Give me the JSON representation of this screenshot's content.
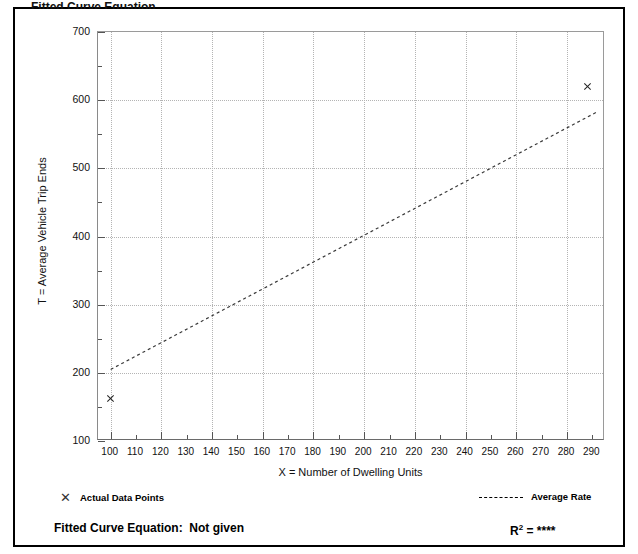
{
  "page": {
    "top_caption": "Fitted Curve Equation"
  },
  "chart_data": {
    "type": "scatter",
    "title": "",
    "xlabel": "X = Number of Dwelling Units",
    "ylabel": "T = Average Vehicle Trip Ends",
    "xlim": [
      95,
      295
    ],
    "ylim": [
      100,
      700
    ],
    "xticks": [
      100,
      110,
      120,
      130,
      140,
      150,
      160,
      170,
      180,
      190,
      200,
      210,
      220,
      230,
      240,
      250,
      260,
      270,
      280,
      290
    ],
    "yticks": [
      100,
      200,
      300,
      400,
      500,
      600,
      700
    ],
    "x_minor_step": 10,
    "x_major_step": 20,
    "y_minor_step": 50,
    "grid": true,
    "legend_position": "bottom",
    "series": [
      {
        "name": "Actual Data Points",
        "type": "scatter",
        "marker": "x",
        "points": [
          {
            "x": 100,
            "y": 163
          },
          {
            "x": 288,
            "y": 620
          }
        ]
      },
      {
        "name": "Average Rate",
        "type": "line",
        "style": "dashed",
        "points": [
          {
            "x": 100,
            "y": 205
          },
          {
            "x": 292,
            "y": 583
          }
        ]
      }
    ],
    "annotations": {
      "fitted_curve_label": "Fitted Curve Equation:",
      "fitted_curve_value": "Not given",
      "r_squared_label": "R",
      "r_squared_exponent": "2",
      "r_squared_equals": "=",
      "r_squared_value": "****"
    }
  },
  "legend": {
    "actual_points_label": "Actual Data Points",
    "actual_points_marker": "x-marker-icon",
    "average_rate_label": "Average Rate",
    "average_rate_marker": "dashed-line-icon"
  }
}
